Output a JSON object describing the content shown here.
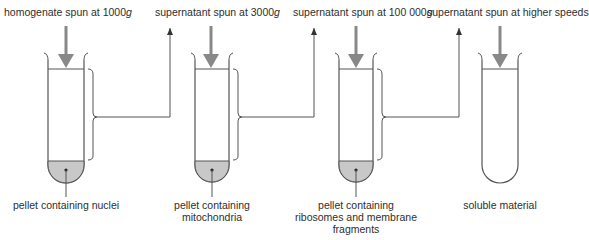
{
  "diagram": {
    "steps": [
      {
        "input_label_prefix": "homogenate spun at 1000",
        "input_label_unit": "g",
        "result_label_line1": "pellet containing nuclei",
        "result_label_line2": "",
        "result_label_line3": "",
        "has_pellet": true
      },
      {
        "input_label_prefix": "supernatant spun at 3000",
        "input_label_unit": "g",
        "result_label_line1": "pellet containing",
        "result_label_line2": "mitochondria",
        "result_label_line3": "",
        "has_pellet": true
      },
      {
        "input_label_prefix": "supernatant spun at 100 000",
        "input_label_unit": "g",
        "result_label_line1": "pellet containing",
        "result_label_line2": "ribosomes and membrane",
        "result_label_line3": "fragments",
        "has_pellet": true
      },
      {
        "input_label_prefix": "supernatant spun at higher speeds",
        "input_label_unit": "",
        "result_label_line1": "soluble material",
        "result_label_line2": "",
        "result_label_line3": "",
        "has_pellet": false
      }
    ],
    "colors": {
      "line": "#555555",
      "arrow": "#888888",
      "pellet_fill": "#c8c8c8",
      "text": "#2e2e2e"
    }
  }
}
